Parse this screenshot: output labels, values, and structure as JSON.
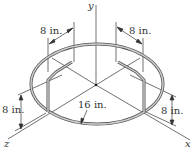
{
  "diagram": {
    "title": "",
    "axes": {
      "x": "x",
      "y": "y",
      "z": "z"
    },
    "dimensions": {
      "left_arm_length": "8 in.",
      "right_arm_length": "8 in.",
      "left_height": "8 in.",
      "right_height": "8 in.",
      "ring_radius": "16 in."
    },
    "colors": {
      "rod": "#9a9a9a",
      "rod_edge": "#555555",
      "line": "#333333"
    }
  }
}
